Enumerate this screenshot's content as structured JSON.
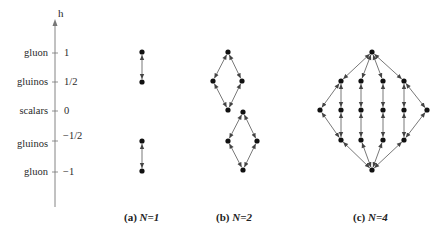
{
  "axis": {
    "label": "h",
    "ticks": [
      {
        "particle": "gluon",
        "value": "1",
        "y": 53
      },
      {
        "particle": "gluinos",
        "value": "1/2",
        "y": 82
      },
      {
        "particle": "scalars",
        "value": "0",
        "y": 111
      },
      {
        "particle": "gluinos",
        "value": "−1/2",
        "y": 141
      },
      {
        "particle": "gluon",
        "value": "−1",
        "y": 172
      }
    ]
  },
  "panels": [
    {
      "id": "a",
      "caption_prefix": "(a) ",
      "caption_math": "N=1",
      "nodes": [
        [
          142,
          52
        ],
        [
          142,
          82
        ],
        [
          142,
          141
        ],
        [
          142,
          171
        ]
      ],
      "edges": [
        [
          0,
          1
        ],
        [
          2,
          3
        ]
      ]
    },
    {
      "id": "b",
      "caption_prefix": "(b) ",
      "caption_math": "N=2",
      "nodes": [
        [
          228,
          52
        ],
        [
          213,
          81
        ],
        [
          242,
          81
        ],
        [
          228,
          110
        ],
        [
          243,
          112
        ],
        [
          228,
          141
        ],
        [
          257,
          141
        ],
        [
          243,
          170
        ]
      ],
      "edges": [
        [
          0,
          1
        ],
        [
          0,
          2
        ],
        [
          1,
          3
        ],
        [
          2,
          3
        ],
        [
          4,
          5
        ],
        [
          4,
          6
        ],
        [
          5,
          7
        ],
        [
          6,
          7
        ]
      ]
    },
    {
      "id": "c",
      "caption_prefix": "(c) ",
      "caption_math": "N=4",
      "nodes": [
        [
          372,
          52
        ],
        [
          341,
          81
        ],
        [
          361,
          81
        ],
        [
          383,
          81
        ],
        [
          404,
          81
        ],
        [
          320,
          110
        ],
        [
          341,
          110
        ],
        [
          361,
          110
        ],
        [
          383,
          110
        ],
        [
          404,
          110
        ],
        [
          427,
          110
        ],
        [
          341,
          140
        ],
        [
          361,
          140
        ],
        [
          383,
          140
        ],
        [
          404,
          140
        ],
        [
          372,
          170
        ]
      ],
      "edges": [
        [
          0,
          1
        ],
        [
          0,
          2
        ],
        [
          0,
          3
        ],
        [
          0,
          4
        ],
        [
          1,
          5
        ],
        [
          1,
          6
        ],
        [
          2,
          7
        ],
        [
          3,
          8
        ],
        [
          4,
          9
        ],
        [
          4,
          10
        ],
        [
          5,
          11
        ],
        [
          6,
          11
        ],
        [
          7,
          12
        ],
        [
          8,
          13
        ],
        [
          9,
          14
        ],
        [
          10,
          14
        ],
        [
          11,
          15
        ],
        [
          12,
          15
        ],
        [
          13,
          15
        ],
        [
          14,
          15
        ]
      ]
    }
  ],
  "colors": {
    "edge": "#555555",
    "node": "#111111",
    "axis": "#777777"
  }
}
